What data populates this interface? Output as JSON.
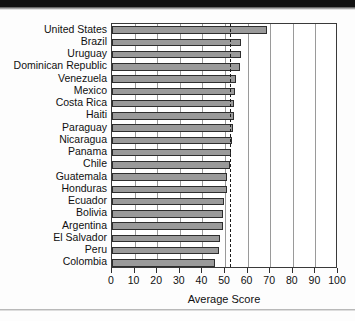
{
  "chart_data": {
    "type": "bar",
    "orientation": "horizontal",
    "title": "",
    "xlabel": "Average Score",
    "ylabel": "",
    "xlim": [
      0,
      100
    ],
    "xticks": [
      0,
      10,
      20,
      30,
      40,
      50,
      60,
      70,
      80,
      90,
      100
    ],
    "grid": true,
    "grid_axis": "x",
    "legend": null,
    "categories": [
      "United States",
      "Brazil",
      "Uruguay",
      "Dominican Republic",
      "Venezuela",
      "Mexico",
      "Costa Rica",
      "Haiti",
      "Paraguay",
      "Nicaragua",
      "Panama",
      "Chile",
      "Guatemala",
      "Honduras",
      "Ecuador",
      "Bolivia",
      "Argentina",
      "El Salvador",
      "Peru",
      "Colombia"
    ],
    "values": [
      68.5,
      57.0,
      57.0,
      56.5,
      55.0,
      54.5,
      54.0,
      54.0,
      53.5,
      53.0,
      52.5,
      52.0,
      51.0,
      51.0,
      49.5,
      49.0,
      49.0,
      48.0,
      47.5,
      45.5
    ],
    "reference_line": {
      "value": 52.0,
      "style": "dashed",
      "color": "#1b1b1b"
    },
    "bar_color": "#9a9a9a",
    "bar_edge_color": "#2e2e2e"
  },
  "axis": {
    "x_title": "Average Score"
  }
}
